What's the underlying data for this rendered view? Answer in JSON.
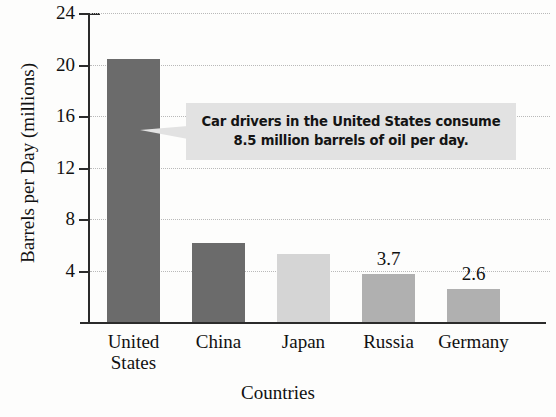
{
  "chart_data": {
    "type": "bar",
    "title": "",
    "xlabel": "Countries",
    "ylabel": "Barrels per Day (millions)",
    "categories": [
      "United States",
      "China",
      "Japan",
      "Russia",
      "Germany"
    ],
    "category_lines": [
      [
        "United",
        "States"
      ],
      [
        "China"
      ],
      [
        "Japan"
      ],
      [
        "Russia"
      ],
      [
        "Germany"
      ]
    ],
    "values": [
      20.4,
      6.1,
      5.3,
      3.7,
      2.6
    ],
    "value_labels": [
      "",
      "",
      "",
      "3.7",
      "2.6"
    ],
    "bar_colors": [
      "#6b6b6b",
      "#6b6b6b",
      "#d5d5d5",
      "#b0b0b0",
      "#b0b0b0"
    ],
    "ylim": [
      0,
      24
    ],
    "yticks": [
      4,
      8,
      12,
      16,
      20,
      24
    ],
    "ytick_labels": [
      "4",
      "8",
      "12",
      "16",
      "20",
      "24"
    ],
    "grid": true,
    "grid_style": "dotted",
    "legend": null
  },
  "annotation": {
    "name": "callout",
    "line1": "Car drivers in the United States consume",
    "line2": "8.5 million barrels of oil per day.",
    "background": "#e2e2e2",
    "points_to": "United States"
  },
  "colors": {
    "axis": "#2b2b2b",
    "grid": "#b9b9b9",
    "text": "#111111",
    "background": "#fdfdfc"
  }
}
